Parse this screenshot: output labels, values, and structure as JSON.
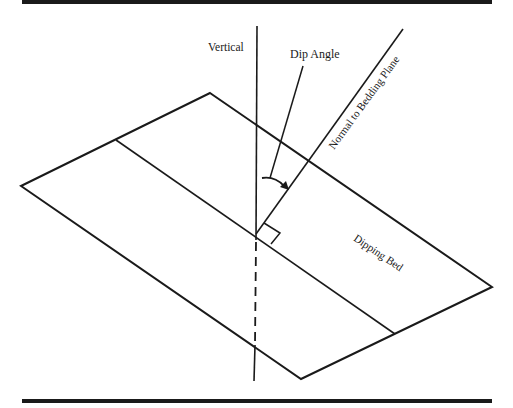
{
  "diagram": {
    "labels": {
      "vertical": "Vertical",
      "dip_angle": "Dip Angle",
      "normal": "Normal to Bedding Plane",
      "dipping_bed": "Dipping Bed"
    },
    "colors": {
      "line": "#1a1a1a",
      "background": "#ffffff"
    }
  }
}
